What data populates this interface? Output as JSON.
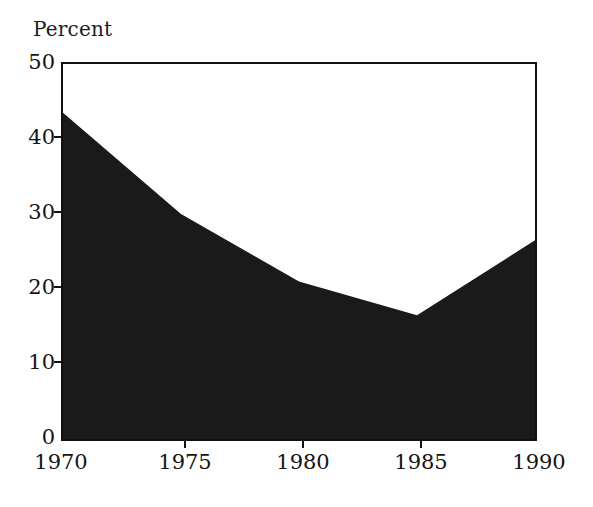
{
  "chart_data": {
    "type": "area",
    "title": "",
    "subtitle": "",
    "xlabel": "",
    "ylabel": "Percent",
    "categories": [
      "1970",
      "1975",
      "1980",
      "1985",
      "1990"
    ],
    "x": [
      1970,
      1975,
      1980,
      1985,
      1990
    ],
    "values": [
      43.5,
      30,
      21,
      16.5,
      26.5
    ],
    "series": [
      {
        "name": "Percent",
        "values": [
          43.5,
          30,
          21,
          16.5,
          26.5
        ]
      }
    ],
    "xlim": [
      1970,
      1990
    ],
    "ylim": [
      0,
      50
    ],
    "y_ticks": [
      0,
      10,
      20,
      30,
      40,
      50
    ],
    "x_ticks": [
      1970,
      1975,
      1980,
      1985,
      1990
    ],
    "grid": false,
    "legend": "none",
    "fill_color": "#1a1a1a",
    "line_color": "#111111",
    "background_color": "#ffffff",
    "axis_color": "#111111"
  },
  "axes": {
    "y_title": "Percent",
    "y_tick_labels": [
      "50",
      "40",
      "30",
      "20",
      "10",
      "0"
    ],
    "x_tick_labels": [
      "1970",
      "1975",
      "1980",
      "1985",
      "1990"
    ]
  }
}
